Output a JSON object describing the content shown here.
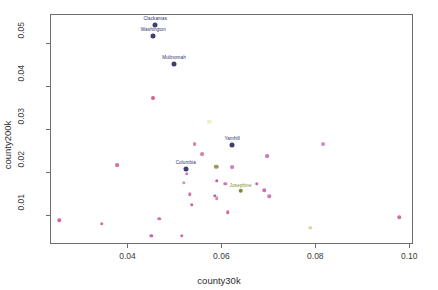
{
  "chart_data": {
    "type": "scatter",
    "title": "",
    "xlabel": "county30k",
    "ylabel": "county200k",
    "xlim": [
      0.0235,
      0.1008
    ],
    "ylim": [
      0.0033,
      0.0568
    ],
    "grid": false,
    "legend": null,
    "xticks": [
      0.04,
      0.06,
      0.08,
      0.1
    ],
    "xtick_labels": [
      "0.04",
      "0.06",
      "0.08",
      "0.10"
    ],
    "yticks": [
      0.01,
      0.02,
      0.03,
      0.04,
      0.05
    ],
    "ytick_labels": [
      "0.01",
      "0.02",
      "0.03",
      "0.04",
      "0.05"
    ],
    "points": [
      {
        "label": "Clackamas",
        "x": 0.0457,
        "y": 0.0545,
        "color": "#3e3f6e",
        "size": 5.0,
        "label_dx": 0,
        "label_dy": -4
      },
      {
        "label": "Washington",
        "x": 0.0453,
        "y": 0.0519,
        "color": "#3e3f6e",
        "size": 5.0,
        "label_dx": 0,
        "label_dy": -4
      },
      {
        "label": "Multnomah",
        "x": 0.0497,
        "y": 0.0454,
        "color": "#3e3f6e",
        "size": 5.0,
        "label_dx": 0,
        "label_dy": -4
      },
      {
        "label": "",
        "x": 0.0452,
        "y": 0.0374,
        "color": "#d4608f",
        "size": 4.0,
        "label_dx": 0,
        "label_dy": -3
      },
      {
        "label": "",
        "x": 0.0572,
        "y": 0.0319,
        "color": "#efeec4",
        "size": 4.4,
        "label_dx": 0,
        "label_dy": -3
      },
      {
        "label": "",
        "x": 0.0815,
        "y": 0.0268,
        "color": "#cf8fc7",
        "size": 3.8,
        "label_dx": 0,
        "label_dy": -3
      },
      {
        "label": "Yamhill",
        "x": 0.0621,
        "y": 0.0265,
        "color": "#3e3f6e",
        "size": 5.0,
        "label_dx": 0,
        "label_dy": -4
      },
      {
        "label": "",
        "x": 0.0541,
        "y": 0.0267,
        "color": "#d77fb0",
        "size": 3.8,
        "label_dx": 0,
        "label_dy": -3
      },
      {
        "label": "",
        "x": 0.0557,
        "y": 0.0245,
        "color": "#d77fb0",
        "size": 3.8,
        "label_dx": 0,
        "label_dy": -3
      },
      {
        "label": "",
        "x": 0.0696,
        "y": 0.0239,
        "color": "#cb78b5",
        "size": 3.8,
        "label_dx": 0,
        "label_dy": -3
      },
      {
        "label": "",
        "x": 0.0375,
        "y": 0.0218,
        "color": "#d06ea3",
        "size": 3.8,
        "label_dx": 0,
        "label_dy": -3
      },
      {
        "label": "Columbia",
        "x": 0.0522,
        "y": 0.021,
        "color": "#3e3f6e",
        "size": 5.0,
        "label_dx": 0,
        "label_dy": -4
      },
      {
        "label": "",
        "x": 0.0587,
        "y": 0.0215,
        "color": "#9b9a5c",
        "size": 4.4,
        "label_dx": 0,
        "label_dy": -3
      },
      {
        "label": "",
        "x": 0.0621,
        "y": 0.0214,
        "color": "#c97fc0",
        "size": 3.8,
        "label_dx": 0,
        "label_dy": -3
      },
      {
        "label": "",
        "x": 0.0524,
        "y": 0.0199,
        "color": "#d079b6",
        "size": 3.5,
        "label_dx": 0,
        "label_dy": -3
      },
      {
        "label": "",
        "x": 0.0518,
        "y": 0.0178,
        "color": "#d48cba",
        "size": 3.5,
        "label_dx": 0,
        "label_dy": -3
      },
      {
        "label": "",
        "x": 0.0588,
        "y": 0.0182,
        "color": "#c9559a",
        "size": 3.5,
        "label_dx": 0,
        "label_dy": -3
      },
      {
        "label": "",
        "x": 0.0606,
        "y": 0.0175,
        "color": "#cf74ab",
        "size": 3.5,
        "label_dx": 0,
        "label_dy": -3
      },
      {
        "label": "",
        "x": 0.0673,
        "y": 0.0176,
        "color": "#c465a6",
        "size": 3.5,
        "label_dx": 0,
        "label_dy": -3
      },
      {
        "label": "Josephine",
        "x": 0.0639,
        "y": 0.0159,
        "color": "#7d8a2e",
        "size": 4.6,
        "label_dx": 0,
        "label_dy": -3
      },
      {
        "label": "",
        "x": 0.0689,
        "y": 0.016,
        "color": "#c676b5",
        "size": 3.5,
        "label_dx": 0,
        "label_dy": -3
      },
      {
        "label": "",
        "x": 0.07,
        "y": 0.0146,
        "color": "#ca7cb8",
        "size": 3.5,
        "label_dx": 0,
        "label_dy": -3
      },
      {
        "label": "",
        "x": 0.053,
        "y": 0.0151,
        "color": "#cd79ab",
        "size": 3.5,
        "label_dx": 0,
        "label_dy": -3
      },
      {
        "label": "",
        "x": 0.0535,
        "y": 0.0127,
        "color": "#c9619f",
        "size": 3.5,
        "label_dx": 0,
        "label_dy": -3
      },
      {
        "label": "",
        "x": 0.0584,
        "y": 0.0148,
        "color": "#c9619f",
        "size": 3.5,
        "label_dx": 0,
        "label_dy": -3
      },
      {
        "label": "",
        "x": 0.0588,
        "y": 0.0142,
        "color": "#d18ebc",
        "size": 3.5,
        "label_dx": 0,
        "label_dy": -3
      },
      {
        "label": "",
        "x": 0.0611,
        "y": 0.0109,
        "color": "#cc6aa8",
        "size": 3.5,
        "label_dx": 0,
        "label_dy": -3
      },
      {
        "label": "",
        "x": 0.0253,
        "y": 0.009,
        "color": "#d26a9f",
        "size": 3.5,
        "label_dx": 0,
        "label_dy": -3
      },
      {
        "label": "",
        "x": 0.0343,
        "y": 0.0082,
        "color": "#d26a9f",
        "size": 3.5,
        "label_dx": 0,
        "label_dy": -3
      },
      {
        "label": "",
        "x": 0.0466,
        "y": 0.0094,
        "color": "#d075ab",
        "size": 3.5,
        "label_dx": 0,
        "label_dy": -3
      },
      {
        "label": "",
        "x": 0.0449,
        "y": 0.0054,
        "color": "#cc6aa0",
        "size": 3.5,
        "label_dx": 0,
        "label_dy": -3
      },
      {
        "label": "",
        "x": 0.0513,
        "y": 0.0054,
        "color": "#cc6aa0",
        "size": 3.5,
        "label_dx": 0,
        "label_dy": -3
      },
      {
        "label": "",
        "x": 0.0787,
        "y": 0.0073,
        "color": "#e0d2a6",
        "size": 3.5,
        "label_dx": 0,
        "label_dy": -3
      },
      {
        "label": "",
        "x": 0.0977,
        "y": 0.0098,
        "color": "#cb6fa6",
        "size": 3.5,
        "label_dx": 0,
        "label_dy": -3
      }
    ]
  },
  "axes": {
    "frame_color": "#6d6d6d"
  }
}
